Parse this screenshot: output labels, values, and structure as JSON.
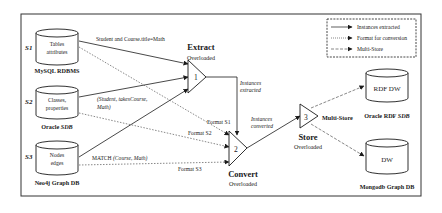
{
  "legend": {
    "items": [
      {
        "label": "Instances extracted",
        "style": "solid"
      },
      {
        "label": "Format for conversion",
        "style": "dotted"
      },
      {
        "label": "Multi-Store",
        "style": "dashed"
      }
    ]
  },
  "sources": [
    {
      "id": "S1",
      "line1": "Tables",
      "line2": "attributes",
      "db_name": "MySQL RDBMS",
      "query": "Student and Course.title=Math",
      "format": "Format S1"
    },
    {
      "id": "S2",
      "line1": "Classes,",
      "line2": "properties",
      "db_name_main": "Oracle ",
      "db_name_italic": "SDB",
      "query_line1": "(Student, takesCourse,",
      "query_line2": "Math)",
      "format": "Format S2"
    },
    {
      "id": "S3",
      "line1": "Nodes",
      "line2": "edges",
      "db_name": "Neo4j Graph DB",
      "query_main": "MATCH ",
      "query_italic": "(Course, Math)",
      "format": "Format S3"
    }
  ],
  "operators": {
    "extract": {
      "number": "1",
      "title": "Extract",
      "subtitle": "Overloaded",
      "output_line1": "Instances",
      "output_line2": "extracted"
    },
    "convert": {
      "number": "2",
      "title": "Convert",
      "subtitle": "Overloaded",
      "output_line1": "Instances",
      "output_line2": "converted"
    },
    "store": {
      "number": "3",
      "title": "Store",
      "subtitle": "Overloaded",
      "side_label": "Multi-Store"
    }
  },
  "targets": [
    {
      "label": "RDF DW",
      "db_name_main": "Oracle RDF ",
      "db_name_italic": "SDB"
    },
    {
      "label": "DW",
      "db_name": "Mongodb Graph DB"
    }
  ]
}
